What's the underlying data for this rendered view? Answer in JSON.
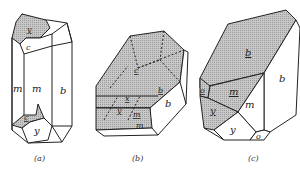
{
  "figures": [
    {
      "id": "a",
      "caption": "(a)",
      "faces": [
        {
          "label": "y",
          "underlined": true,
          "shaded": true,
          "position": "top"
        },
        {
          "label": "c",
          "underlined": false,
          "shaded": false,
          "position": "top"
        },
        {
          "label": "m",
          "underlined": false,
          "shaded": false,
          "position": "left"
        },
        {
          "label": "m",
          "underlined": false,
          "shaded": false,
          "position": "front"
        },
        {
          "label": "b",
          "underlined": false,
          "shaded": false,
          "position": "right"
        },
        {
          "label": "c",
          "underlined": true,
          "shaded": true,
          "position": "bottom"
        },
        {
          "label": "y",
          "underlined": false,
          "shaded": false,
          "position": "bottom"
        }
      ]
    },
    {
      "id": "b",
      "caption": "(b)",
      "faces": [
        {
          "label": "c",
          "underlined": true,
          "shaded": true,
          "position": "top"
        },
        {
          "label": "b",
          "underlined": true,
          "shaded": true,
          "position": "upper-right"
        },
        {
          "label": "b",
          "underlined": false,
          "shaded": false,
          "position": "right"
        },
        {
          "label": "x",
          "underlined": true,
          "shaded": true,
          "position": "middle"
        },
        {
          "label": "y",
          "underlined": true,
          "shaded": true,
          "position": "middle"
        },
        {
          "label": "m",
          "underlined": true,
          "shaded": true,
          "position": "lower"
        },
        {
          "label": "m",
          "underlined": false,
          "shaded": false,
          "position": "bottom"
        }
      ]
    },
    {
      "id": "c",
      "caption": "(c)",
      "faces": [
        {
          "label": "b",
          "underlined": true,
          "shaded": true,
          "position": "top"
        },
        {
          "label": "b",
          "underlined": false,
          "shaded": false,
          "position": "right"
        },
        {
          "label": "o",
          "underlined": true,
          "shaded": true,
          "position": "left"
        },
        {
          "label": "m",
          "underlined": true,
          "shaded": true,
          "position": "middle-left"
        },
        {
          "label": "m",
          "underlined": false,
          "shaded": false,
          "position": "middle-right"
        },
        {
          "label": "y",
          "underlined": true,
          "shaded": true,
          "position": "lower-left"
        },
        {
          "label": "y",
          "underlined": false,
          "shaded": false,
          "position": "bottom"
        },
        {
          "label": "o",
          "underlined": false,
          "shaded": false,
          "position": "bottom-right"
        }
      ]
    }
  ],
  "colors": {
    "shade": "#bdbdbd",
    "line": "#222222",
    "background": "#ffffff"
  }
}
